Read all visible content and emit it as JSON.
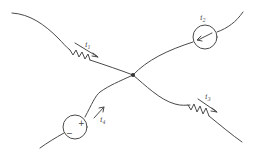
{
  "diagram": {
    "type": "circuit-node",
    "node": {
      "x": 133,
      "y": 75
    },
    "branches": [
      {
        "id": "b1",
        "element": "resistor",
        "label": "i",
        "subscript": "1",
        "arrow": "toward node"
      },
      {
        "id": "b2",
        "element": "current-source",
        "label": "i",
        "subscript": "2",
        "arrow": "toward node"
      },
      {
        "id": "b3",
        "element": "resistor",
        "label": "i",
        "subscript": "3",
        "arrow": "away from node"
      },
      {
        "id": "b4",
        "element": "voltage-source",
        "label": "i",
        "subscript": "4",
        "arrow": "toward node",
        "plus": "+",
        "minus": "−"
      }
    ],
    "colors": {
      "stroke": "#4a4a4a",
      "background": "#ffffff"
    }
  }
}
